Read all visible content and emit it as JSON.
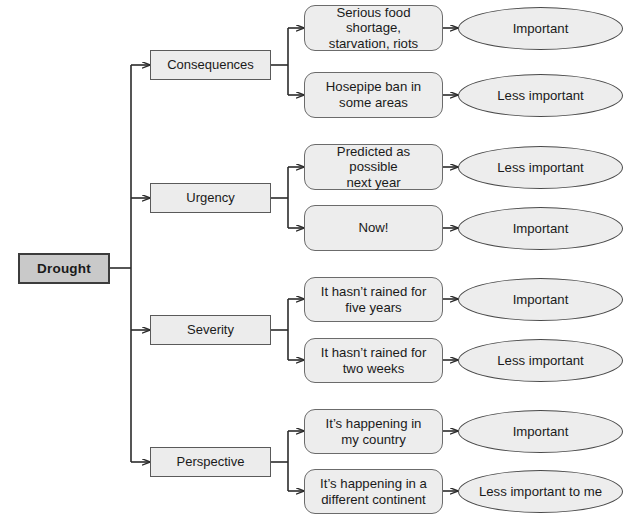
{
  "diagram": {
    "colors": {
      "root_fill": "#c9c9c9",
      "root_border": "#3c3c3c",
      "category_fill": "#ececec",
      "category_border": "#5a5a5a",
      "leaf_fill": "#ededed",
      "leaf_border": "#6b6b6b",
      "terminal_fill": "#ededed",
      "terminal_border": "#4a4a4a",
      "connector": "#2b2b2b",
      "background": "#ffffff"
    },
    "root": {
      "label": "Drought"
    },
    "branches": [
      {
        "category": "Consequences",
        "leaves": [
          {
            "text": "Serious food shortage, starvation, riots",
            "line1": "Serious food shortage,",
            "line2": "starvation, riots",
            "verdict": "Important"
          },
          {
            "text": "Hosepipe ban in some areas",
            "line1": "Hosepipe ban in",
            "line2": "some areas",
            "verdict": "Less important"
          }
        ]
      },
      {
        "category": "Urgency",
        "leaves": [
          {
            "text": "Predicted as possible next year",
            "line1": "Predicted as possible",
            "line2": "next year",
            "verdict": "Less important"
          },
          {
            "text": "Now!",
            "line1": "Now!",
            "line2": "",
            "verdict": "Important"
          }
        ]
      },
      {
        "category": "Severity",
        "leaves": [
          {
            "text": "It hasn’t rained for five years",
            "line1": "It hasn’t rained for",
            "line2": "five years",
            "verdict": "Important"
          },
          {
            "text": "It hasn’t rained for two weeks",
            "line1": "It hasn’t rained for",
            "line2": "two weeks",
            "verdict": "Less important"
          }
        ]
      },
      {
        "category": "Perspective",
        "leaves": [
          {
            "text": "It’s happening in my country",
            "line1": "It’s happening in",
            "line2": "my country",
            "verdict": "Important"
          },
          {
            "text": "It’s happening in a different continent",
            "line1": "It’s happening in a",
            "line2": "different continent",
            "verdict": "Less important to me"
          }
        ]
      }
    ]
  }
}
